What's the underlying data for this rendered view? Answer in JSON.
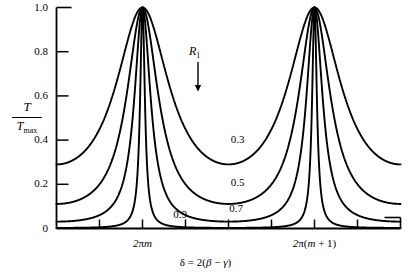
{
  "chart_data": {
    "type": "line",
    "title": "",
    "subtitle": "",
    "xlabel": "δ = 2(β − γ)",
    "ylabel": "T / T_max",
    "ylabel_numerator": "T",
    "ylabel_denominator": "T",
    "ylabel_denominator_sub": "max",
    "ylim": [
      0,
      1.0
    ],
    "xlim": [
      -3.14159,
      9.42478
    ],
    "grid": false,
    "legend_position": "inside-upper-middle",
    "legend_title": "R",
    "legend_title_sub": "1",
    "legend_arrow": "↓",
    "formula": "T/Tmax = 1 / (1 + F sin^2(delta/2)), F = 4R/(1-R)^2",
    "y_ticks": [
      {
        "value": 1.0,
        "label": "1.0"
      },
      {
        "value": 0.8,
        "label": "0.8"
      },
      {
        "value": 0.6,
        "label": "0.6"
      },
      {
        "value": 0.4,
        "label": "0.4"
      },
      {
        "value": 0.2,
        "label": "0.2"
      },
      {
        "value": 0.0,
        "label": "0"
      }
    ],
    "x_ticks": [
      {
        "value": -1.5708,
        "label": ""
      },
      {
        "value": 0.0,
        "label": "2πm",
        "label_html": "2<span class=\"rm\">π</span>m"
      },
      {
        "value": 1.5708,
        "label": ""
      },
      {
        "value": 3.14159,
        "label": ""
      },
      {
        "value": 4.71239,
        "label": ""
      },
      {
        "value": 6.28319,
        "label": "2π(m + 1)"
      },
      {
        "value": 7.85398,
        "label": ""
      }
    ],
    "x_tick_labels_visible": [
      "2πm",
      "2π(m + 1)"
    ],
    "peaks": [
      {
        "x_label": "2πm",
        "x": 0.0,
        "y": 1.0
      },
      {
        "x_label": "2π(m + 1)",
        "x": 6.28319,
        "y": 1.0
      }
    ],
    "series": [
      {
        "name": "0.3",
        "reflectance": 0.3,
        "finesse_F": 2.449,
        "label": "0.3",
        "label_x": 3.55,
        "label_y": 0.395,
        "peak_value": 1.0,
        "min_value": 0.29,
        "value_at_left_edge": 0.286
      },
      {
        "name": "0.5",
        "reflectance": 0.5,
        "finesse_F": 8.0,
        "label": "0.5",
        "label_x": 3.55,
        "label_y": 0.2,
        "peak_value": 1.0,
        "min_value": 0.111,
        "value_at_left_edge": 0.111
      },
      {
        "name": "0.7",
        "reflectance": 0.7,
        "finesse_F": 31.111,
        "label": "0.7",
        "label_x": 3.5,
        "label_y": 0.085,
        "peak_value": 1.0,
        "min_value": 0.031,
        "value_at_left_edge": 0.031
      },
      {
        "name": "0.9",
        "reflectance": 0.9,
        "finesse_F": 360.0,
        "label": "0.9",
        "label_x": 1.45,
        "label_y": 0.058,
        "peak_value": 1.0,
        "min_value": 0.0028,
        "value_at_left_edge": 0.0028
      }
    ]
  },
  "figure": {
    "background_color": "#ffffff",
    "line_color": "#000000",
    "axis_color": "#000000"
  }
}
